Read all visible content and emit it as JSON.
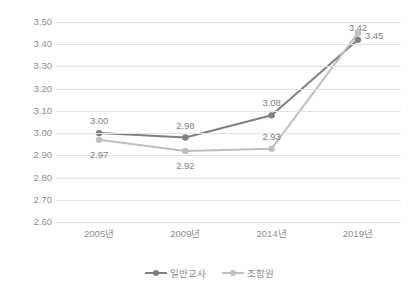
{
  "chart_data": {
    "type": "line",
    "title": "",
    "xlabel": "",
    "ylabel": "",
    "categories": [
      "2005년",
      "2009년",
      "2014년",
      "2019년"
    ],
    "ylim": [
      2.6,
      3.5
    ],
    "ytick_step": 0.1,
    "ytick_labels": [
      "3.50",
      "3.40",
      "3.30",
      "3.20",
      "3.10",
      "3.00",
      "2.90",
      "2.80",
      "2.70",
      "2.60"
    ],
    "ytick_values": [
      3.5,
      3.4,
      3.3,
      3.2,
      3.1,
      3.0,
      2.9,
      2.8,
      2.7,
      2.6
    ],
    "grid": "horizontal",
    "legend_position": "bottom-center",
    "series": [
      {
        "name": "일반교사",
        "color": "#808080",
        "values": [
          3.0,
          2.98,
          3.08,
          3.42
        ],
        "labels": [
          "3.00",
          "2.98",
          "3.08",
          "3.42"
        ],
        "label_placement": [
          "above",
          "above",
          "above",
          "above"
        ]
      },
      {
        "name": "조합원",
        "color": "#bfbfbf",
        "values": [
          2.97,
          2.92,
          2.93,
          3.45
        ],
        "labels": [
          "2.97",
          "2.92",
          "2.93",
          "3.45"
        ],
        "label_placement": [
          "below",
          "below",
          "above",
          "right"
        ]
      }
    ]
  },
  "legend": {
    "items": [
      {
        "label": "일반교사",
        "color": "#808080"
      },
      {
        "label": "조합원",
        "color": "#bfbfbf"
      }
    ]
  },
  "colors": {
    "background": "#ffffff",
    "gridline": "#e2e2e2",
    "axis_text": "#8c8c8c",
    "label_text": "#7f7f7f",
    "series_1": "#808080",
    "series_2": "#bfbfbf"
  }
}
